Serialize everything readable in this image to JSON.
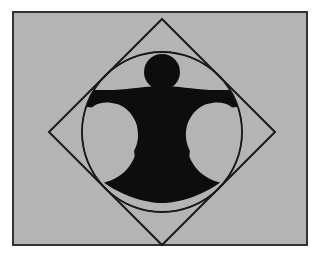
{
  "image": {
    "title": "Vitruvian-style silhouette in square and circle",
    "width": 326,
    "height": 265,
    "background_color": "#ffffff",
    "panel_color": "#b4b4b4",
    "frame_color": "#333333",
    "stroke_color": "#1a1a1a",
    "figure_color": "#0d0d0d",
    "negative_color": "#b4b4b4"
  },
  "panel": {
    "x": 12,
    "y": 11,
    "width": 296,
    "height": 235,
    "border_width": 2
  },
  "shapes": {
    "diamond": {
      "name": "rotated-square",
      "center_x": 162,
      "center_y": 132,
      "half_diagonal": 113,
      "stroke_width": 2,
      "points": "162,19 275,132 162,245 49,132"
    },
    "circle": {
      "name": "enclosing-circle",
      "center_x": 162,
      "center_y": 132,
      "radius": 80,
      "stroke_width": 2
    },
    "head": {
      "name": "head-circle",
      "center_x": 162,
      "center_y": 72,
      "radius": 18
    },
    "body": {
      "name": "torso-and-limbs",
      "arm_span_left_x": 85,
      "arm_span_right_x": 239,
      "arm_top_y": 88,
      "arm_bottom_y": 106,
      "torso_half_width": 24,
      "hip_y": 175
    },
    "negative_left": {
      "name": "left-void-lobe",
      "center_x": 113,
      "center_y": 137,
      "rx": 26,
      "ry": 32
    },
    "negative_right": {
      "name": "right-void-lobe",
      "center_x": 211,
      "center_y": 137,
      "rx": 26,
      "ry": 32
    },
    "negative_bottom": {
      "name": "bottom-void-crescent",
      "left_x": 96,
      "right_x": 228,
      "top_y": 176,
      "bottom_y": 212
    }
  },
  "labels": {
    "alt_text": "Black human silhouette with head, outstretched arms and legs inscribed within a circle and a rotated square on a gray panel"
  }
}
